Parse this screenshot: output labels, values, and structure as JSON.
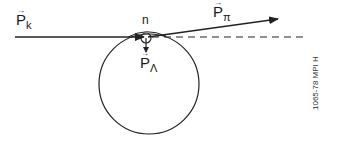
{
  "diagram": {
    "labels": {
      "kaon": {
        "symbol": "P",
        "subscript": "k",
        "vector_arrow": "→"
      },
      "pion": {
        "symbol": "P",
        "subscript": "π",
        "vector_arrow": "→"
      },
      "lambda": {
        "symbol": "P",
        "subscript": "Λ",
        "vector_arrow": "→"
      },
      "neutron": "n"
    },
    "side_note": "1065-78  MPI H",
    "colors": {
      "stroke": "#222222",
      "background": "#ffffff"
    }
  }
}
